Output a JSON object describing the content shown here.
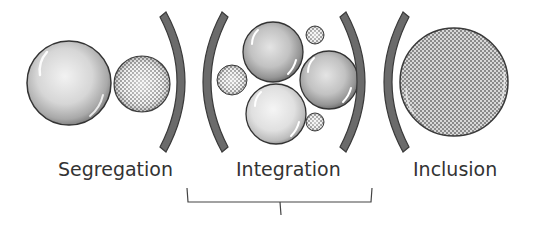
{
  "labels": {
    "segregation": "Segregation",
    "integration": "Integration",
    "inclusion": "Inclusion"
  },
  "colors": {
    "arc_fill": "#6b6b6b",
    "arc_stroke": "#3a3a3a",
    "sphere_outline": "#333333",
    "text": "#333333",
    "checker_dark": "#777777",
    "checker_light": "#ffffff"
  }
}
